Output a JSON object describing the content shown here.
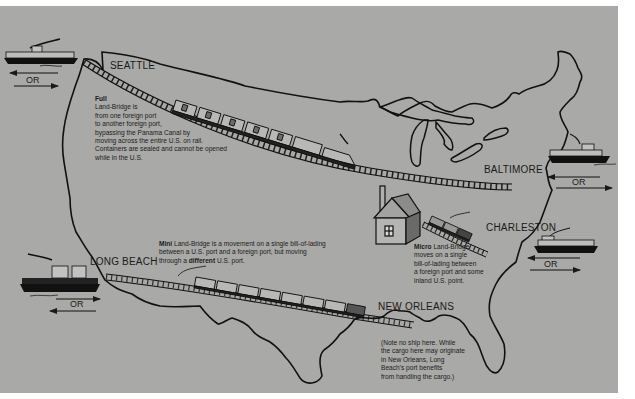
{
  "colors": {
    "background": "#a9a9a7",
    "ink": "#1a1a1a",
    "page": "#ffffff"
  },
  "ports": {
    "seattle": "SEATTLE",
    "baltimore": "BALTIMORE",
    "charleston": "CHARLESTON",
    "long_beach": "LONG BEACH",
    "new_orleans": "NEW ORLEANS"
  },
  "ship_or_label": "OR",
  "captions": {
    "full": {
      "title": "Full",
      "lines": [
        "Land-Bridge is",
        "from one foreign port",
        "to another foreign port,",
        "bypassing the Panama Canal by",
        "moving across the entire U.S. on rail.",
        "Containers are sealed and cannot be opened",
        "while in the U.S."
      ]
    },
    "mini": {
      "title": "Mini",
      "line1_rest": " Land-Bridge is a movement on a single bill-of-lading",
      "line2": "between a U.S. port and a foreign port, but moving",
      "line3_pre": "through a ",
      "line3_bold": "different",
      "line3_post": " U.S. port."
    },
    "micro": {
      "title": "Micro",
      "line1_rest": " Land-Bridge",
      "lines": [
        "moves on a single",
        "bill-of-lading between",
        "a foreign port and some",
        "inland U.S. point."
      ]
    },
    "note": {
      "lines": [
        "(Note no ship here. While",
        "the cargo here may originate",
        "in New Orleans, Long",
        "Beach's port benefits",
        "from handling the cargo.)"
      ]
    }
  },
  "icons": [
    "ship-icon",
    "train-icon",
    "house-icon",
    "railroad-track-icon",
    "arrow-left-icon",
    "arrow-right-icon"
  ]
}
